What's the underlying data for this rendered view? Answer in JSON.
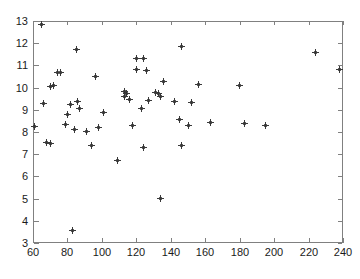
{
  "chart_data": {
    "type": "scatter",
    "title": "",
    "subtitle": "",
    "xlabel": "",
    "ylabel": "",
    "xlim": [
      60,
      240
    ],
    "ylim": [
      3,
      13
    ],
    "xticks": [
      60,
      80,
      100,
      120,
      140,
      160,
      180,
      200,
      220,
      240
    ],
    "yticks": [
      3,
      4,
      5,
      6,
      7,
      8,
      9,
      10,
      11,
      12,
      13
    ],
    "grid": false,
    "legend": null,
    "marker": "plus",
    "marker_color": "#333333",
    "axis_color": "#808080",
    "background": "#ffffff",
    "series": [
      {
        "name": "data",
        "points": [
          [
            65,
            12.86
          ],
          [
            85,
            11.71
          ],
          [
            146,
            11.85
          ],
          [
            120,
            11.31
          ],
          [
            124,
            11.31
          ],
          [
            224,
            11.58
          ],
          [
            238,
            10.8
          ],
          [
            120,
            10.82
          ],
          [
            126,
            10.75
          ],
          [
            96,
            10.5
          ],
          [
            74,
            10.68
          ],
          [
            76,
            10.67
          ],
          [
            70,
            10.05
          ],
          [
            72,
            10.09
          ],
          [
            136,
            10.27
          ],
          [
            156,
            10.14
          ],
          [
            180,
            10.09
          ],
          [
            113,
            9.84
          ],
          [
            114,
            9.73
          ],
          [
            113,
            9.62
          ],
          [
            116,
            9.45
          ],
          [
            131,
            9.76
          ],
          [
            133,
            9.73
          ],
          [
            134,
            9.59
          ],
          [
            127,
            9.41
          ],
          [
            142,
            9.38
          ],
          [
            152,
            9.32
          ],
          [
            123,
            9.06
          ],
          [
            66,
            9.28
          ],
          [
            82,
            9.22
          ],
          [
            86,
            9.36
          ],
          [
            87,
            9.04
          ],
          [
            80,
            8.81
          ],
          [
            79,
            8.34
          ],
          [
            84,
            8.1
          ],
          [
            91,
            8.04
          ],
          [
            101,
            8.88
          ],
          [
            98,
            8.21
          ],
          [
            118,
            8.31
          ],
          [
            145,
            8.58
          ],
          [
            150,
            8.3
          ],
          [
            163,
            8.43
          ],
          [
            183,
            8.37
          ],
          [
            195,
            8.3
          ],
          [
            61,
            8.25
          ],
          [
            68,
            7.52
          ],
          [
            70,
            7.47
          ],
          [
            94,
            7.41
          ],
          [
            124,
            7.3
          ],
          [
            146,
            7.4
          ],
          [
            109,
            6.7
          ],
          [
            134,
            5.0
          ],
          [
            83,
            3.58
          ]
        ]
      }
    ]
  },
  "axes": {
    "x_tick_labels": [
      "60",
      "80",
      "100",
      "120",
      "140",
      "160",
      "180",
      "200",
      "220",
      "240"
    ],
    "y_tick_labels": [
      "3",
      "4",
      "5",
      "6",
      "7",
      "8",
      "9",
      "10",
      "11",
      "12",
      "13"
    ]
  }
}
